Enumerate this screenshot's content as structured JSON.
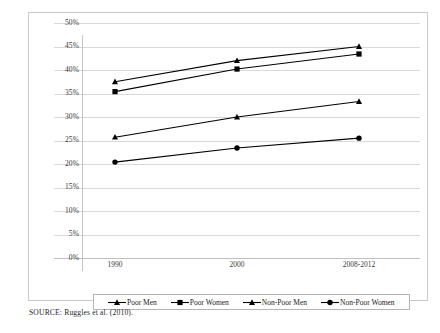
{
  "chart_data": {
    "type": "line",
    "title": "",
    "subtitle": "",
    "xlabel": "",
    "ylabel": "",
    "categories": [
      "1990",
      "2000",
      "2008-2012"
    ],
    "ylim": [
      0,
      50
    ],
    "ytick_labels": [
      "50%",
      "45%",
      "40%",
      "35%",
      "30%",
      "25%",
      "20%",
      "15%",
      "10%",
      "5%",
      "0%"
    ],
    "ytick_values": [
      50,
      45,
      40,
      35,
      30,
      25,
      20,
      15,
      10,
      5,
      0
    ],
    "ytick_step": 5,
    "yaxis_format": "percent",
    "grid": true,
    "legend_position": "bottom",
    "series": [
      {
        "name": "Poor Men",
        "marker": "triangle",
        "values": [
          37.5,
          42.0,
          45.0
        ]
      },
      {
        "name": "Poor Women",
        "marker": "square",
        "values": [
          35.4,
          40.2,
          43.4
        ]
      },
      {
        "name": "Non-Poor Men",
        "marker": "triangle",
        "values": [
          25.7,
          30.0,
          33.3
        ]
      },
      {
        "name": "Non-Poor Women",
        "marker": "circle",
        "values": [
          20.4,
          23.4,
          25.5
        ]
      }
    ],
    "line_color": "#000000",
    "grid_color": "#d9d9d9"
  },
  "legend": {
    "items": [
      {
        "label": "Poor Men"
      },
      {
        "label": "Poor Women"
      },
      {
        "label": "Non-Poor Men"
      },
      {
        "label": "Non-Poor Women"
      }
    ]
  },
  "source": {
    "text": "SOURCE:  Ruggles et al. (2010)."
  }
}
